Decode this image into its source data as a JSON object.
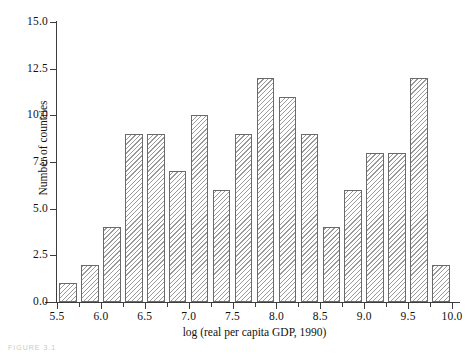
{
  "chart_data": {
    "type": "bar",
    "subtype": "histogram",
    "title": "",
    "xlabel": "log (real per capita GDP, 1990)",
    "ylabel": "Number of countries",
    "xlim": [
      5.5,
      10.0
    ],
    "ylim": [
      0.0,
      15.0
    ],
    "bin_width": 0.25,
    "grid": false,
    "legend": null,
    "xticks": [
      5.5,
      6.0,
      6.5,
      7.0,
      7.5,
      8.0,
      8.5,
      9.0,
      9.5,
      10.0
    ],
    "xticklabels": [
      "5.5",
      "6.0",
      "6.5",
      "7.0",
      "7.5",
      "8.0",
      "8.5",
      "9.0",
      "9.5",
      "10.0"
    ],
    "yticks": [
      0.0,
      2.5,
      5.0,
      7.5,
      10.0,
      12.5,
      15.0
    ],
    "yticklabels": [
      "0.0",
      "2.5",
      "5.0",
      "7.5",
      "10.0",
      "12.5",
      "15.0"
    ],
    "bin_edges": [
      5.5,
      5.75,
      6.0,
      6.25,
      6.5,
      6.75,
      7.0,
      7.25,
      7.5,
      7.75,
      8.0,
      8.25,
      8.5,
      8.75,
      9.0,
      9.25,
      9.5,
      9.75,
      10.0
    ],
    "categories": [
      "5.50-5.75",
      "5.75-6.00",
      "6.00-6.25",
      "6.25-6.50",
      "6.50-6.75",
      "6.75-7.00",
      "7.00-7.25",
      "7.25-7.50",
      "7.50-7.75",
      "7.75-8.00",
      "8.00-8.25",
      "8.25-8.50",
      "8.50-8.75",
      "8.75-9.00",
      "9.00-9.25",
      "9.25-9.50",
      "9.50-9.75",
      "9.75-10.00"
    ],
    "values": [
      1,
      2,
      4,
      9,
      9,
      7,
      10,
      6,
      9,
      12,
      11,
      9,
      4,
      6,
      8,
      8,
      12,
      2
    ],
    "bar_fill": "hatched-diagonal",
    "bar_edge_color": "#6a6a6a",
    "bar_hatch_color": "#9a9a9a"
  },
  "figure": {
    "caption": "FIGURE 3.1"
  }
}
